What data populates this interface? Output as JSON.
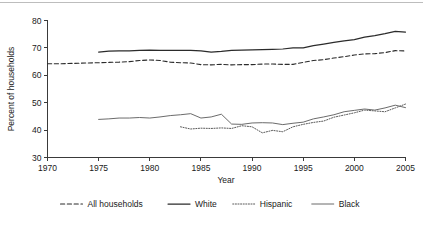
{
  "chart_data": {
    "type": "line",
    "title": "",
    "xlabel": "Year",
    "ylabel": "Percent of households",
    "xlim": [
      1970,
      2005
    ],
    "ylim": [
      30,
      80
    ],
    "xticks": [
      1970,
      1975,
      1980,
      1985,
      1990,
      1995,
      2000,
      2005
    ],
    "yticks": [
      30,
      40,
      50,
      60,
      70,
      80
    ],
    "grid": false,
    "legend_position": "bottom",
    "series": [
      {
        "name": "All households",
        "style": "dashed",
        "x": [
          1970,
          1971,
          1972,
          1973,
          1974,
          1975,
          1976,
          1977,
          1978,
          1979,
          1980,
          1981,
          1982,
          1983,
          1984,
          1985,
          1986,
          1987,
          1988,
          1989,
          1990,
          1991,
          1992,
          1993,
          1994,
          1995,
          1996,
          1997,
          1998,
          1999,
          2000,
          2001,
          2002,
          2003,
          2004,
          2005
        ],
        "values": [
          64.2,
          64.2,
          64.3,
          64.4,
          64.5,
          64.6,
          64.7,
          64.8,
          65.0,
          65.4,
          65.6,
          65.4,
          64.8,
          64.6,
          64.5,
          63.9,
          63.8,
          64.0,
          63.8,
          63.9,
          63.9,
          64.1,
          64.1,
          64.0,
          64.0,
          64.7,
          65.4,
          65.7,
          66.3,
          66.8,
          67.4,
          67.8,
          67.9,
          68.3,
          69.0,
          68.9
        ]
      },
      {
        "name": "White",
        "style": "solid",
        "x": [
          1975,
          1976,
          1977,
          1978,
          1979,
          1980,
          1981,
          1982,
          1983,
          1984,
          1985,
          1986,
          1987,
          1988,
          1989,
          1990,
          1991,
          1992,
          1993,
          1994,
          1995,
          1996,
          1997,
          1998,
          1999,
          2000,
          2001,
          2002,
          2003,
          2004,
          2005
        ],
        "values": [
          68.5,
          68.8,
          68.9,
          68.9,
          69.1,
          69.2,
          69.1,
          69.1,
          69.1,
          69.1,
          68.9,
          68.5,
          68.7,
          69.1,
          69.2,
          69.3,
          69.4,
          69.5,
          69.6,
          70.0,
          70.0,
          70.8,
          71.4,
          72.0,
          72.6,
          73.0,
          73.9,
          74.5,
          75.2,
          76.0,
          75.8
        ]
      },
      {
        "name": "Hispanic",
        "style": "dotted",
        "x": [
          1983,
          1984,
          1985,
          1986,
          1987,
          1988,
          1989,
          1990,
          1991,
          1992,
          1993,
          1994,
          1995,
          1996,
          1997,
          1998,
          1999,
          2000,
          2001,
          2002,
          2003,
          2004,
          2005
        ],
        "values": [
          41.2,
          40.4,
          40.7,
          40.6,
          40.8,
          40.6,
          41.6,
          41.2,
          39.0,
          39.9,
          39.4,
          41.2,
          42.1,
          42.8,
          43.3,
          44.7,
          45.5,
          46.3,
          47.3,
          47.0,
          46.7,
          48.1,
          49.5
        ]
      },
      {
        "name": "Black",
        "style": "solid-thin",
        "x": [
          1975,
          1976,
          1977,
          1978,
          1979,
          1980,
          1981,
          1982,
          1983,
          1984,
          1985,
          1986,
          1987,
          1988,
          1989,
          1990,
          1991,
          1992,
          1993,
          1994,
          1995,
          1996,
          1997,
          1998,
          1999,
          2000,
          2001,
          2002,
          2003,
          2004,
          2005
        ],
        "values": [
          43.9,
          44.1,
          44.4,
          44.4,
          44.6,
          44.4,
          44.8,
          45.3,
          45.6,
          46.0,
          44.4,
          44.8,
          45.8,
          42.2,
          42.1,
          42.6,
          42.7,
          42.6,
          42.0,
          42.5,
          42.9,
          44.1,
          44.8,
          45.6,
          46.7,
          47.2,
          47.7,
          47.3,
          48.1,
          49.1,
          48.2
        ]
      }
    ]
  },
  "legend": {
    "items": [
      {
        "label": "All households",
        "style": "dashed"
      },
      {
        "label": "White",
        "style": "solid"
      },
      {
        "label": "Hispanic",
        "style": "dotted"
      },
      {
        "label": "Black",
        "style": "solid-thin"
      }
    ]
  },
  "colors": {
    "ink": "#1a1a1a",
    "axis": "#3a3a3a",
    "all_households": "#2b2b2b",
    "white": "#2b2b2b",
    "hispanic": "#5a5a5a",
    "black": "#6b6b6b",
    "top_rule": "#bdbdbd",
    "background": "#ffffff"
  }
}
